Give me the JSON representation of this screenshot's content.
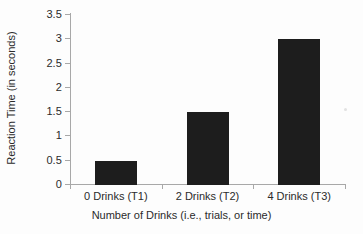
{
  "chart_data": {
    "type": "bar",
    "title": "",
    "subtitle": "",
    "xlabel": "Number of Drinks (i.e., trials, or time)",
    "ylabel": "Reaction Time (in seconds)",
    "categories": [
      "0 Drinks (T1)",
      "2 Drinks (T2)",
      "4 Drinks (T3)"
    ],
    "values": [
      0.5,
      1.5,
      3
    ],
    "ylim": [
      0,
      3.5
    ],
    "ytick_labels": [
      "0",
      "0.5",
      "1",
      "1.5",
      "2",
      "2.5",
      "3",
      "3.5"
    ],
    "ytick_values": [
      0,
      0.5,
      1,
      1.5,
      2,
      2.5,
      3,
      3.5
    ],
    "grid": false,
    "legend": false,
    "legend_position": "none",
    "bar_color": "#1d1d1d",
    "axis_color": "#a8a8a8",
    "text_color": "#2b2b2b",
    "background_color": "#fdfdfd"
  }
}
